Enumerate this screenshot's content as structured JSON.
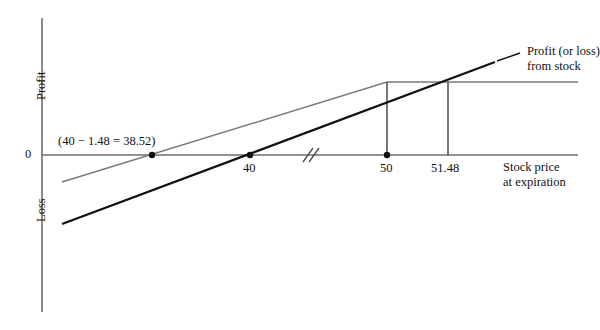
{
  "figure": {
    "type": "payoff-diagram",
    "background": "#ffffff"
  },
  "axes": {
    "y_upper_label": "Profit",
    "y_lower_label": "Loss",
    "x_label_line1": "Stock price",
    "x_label_line2": "at expiration",
    "zero_label": "0",
    "axis_break_glyph": "//",
    "x_origin_px": 42,
    "zero_y_px": 155
  },
  "ticks": [
    {
      "label": "40",
      "x_px": 250,
      "dot": true
    },
    {
      "label": "50",
      "x_px": 387,
      "dot": true
    },
    {
      "label": "51.48",
      "x_px": 448,
      "dot": false
    }
  ],
  "annotations": [
    {
      "text": "(40 − 1.48 = 38.52)",
      "x_px": 58,
      "y_px": 136,
      "dot_x_px": 152
    }
  ],
  "series_labels": [
    {
      "line1": "Profit (or loss)",
      "line2": "from stock",
      "x_px": 527,
      "y_px": 48
    }
  ],
  "colors": {
    "axis": "#6f6f6f",
    "stock_line": "#111111",
    "strategy_line": "#7a7a7a",
    "plateau_line": "#7a7a7a",
    "dot": "#111111",
    "drop_line": "#4a4a4a",
    "text": "#111111"
  },
  "chart_data": {
    "type": "line",
    "title": "",
    "xlabel": "Stock price at expiration",
    "ylabel": "Profit / Loss",
    "grid": false,
    "legend": "inline-annotation",
    "axis_break_at_x": 45,
    "x_reference_points": [
      38.52,
      40,
      50,
      51.48
    ],
    "series": [
      {
        "name": "Profit (or loss) from stock",
        "color": "#111111",
        "style": "solid-thick",
        "points_px": [
          [
            62,
            224
          ],
          [
            250,
            155
          ],
          [
            495,
            62
          ]
        ],
        "zero_crossing_x": 40,
        "description": "Long stock payoff: straight line crossing zero at 40"
      },
      {
        "name": "Covered call / strategy payoff",
        "color": "#7a7a7a",
        "style": "solid-thin",
        "points_px": [
          [
            62,
            182
          ],
          [
            387,
            82
          ],
          [
            578,
            82
          ]
        ],
        "zero_crossing_x": 38.52,
        "cap_at_x": 50,
        "description": "Rises to cap at stock price 50, then flat (capped profit)"
      }
    ],
    "drop_lines_px": [
      {
        "x": 387,
        "y_top": 82,
        "y_bottom": 155
      },
      {
        "x": 448,
        "y_top": 82,
        "y_bottom": 155
      }
    ]
  }
}
